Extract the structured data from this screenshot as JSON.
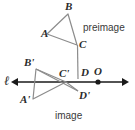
{
  "figure": {
    "background_color": "#ffffff",
    "stroke_color": "#808080",
    "line_color": "#1a1a1a",
    "label_color": "#2b2b2b"
  },
  "labels": {
    "A": "A",
    "B": "B",
    "C": "C",
    "D": "D",
    "O": "O",
    "A_prime": "A'",
    "B_prime": "B'",
    "C_prime": "C'",
    "D_prime": "D'",
    "line_l": "ℓ",
    "preimage": "preimage",
    "image": "image"
  },
  "geometry": {
    "preimage_points": {
      "A": [
        47,
        34
      ],
      "B": [
        68,
        14
      ],
      "C": [
        77,
        45
      ],
      "D": [
        78,
        78
      ]
    },
    "image_points": {
      "A_prime": [
        33,
        99
      ],
      "B_prime": [
        36,
        69
      ],
      "C_prime": [
        66,
        82
      ],
      "D_prime": [
        77,
        91
      ]
    },
    "center_point_O": [
      98,
      82
    ],
    "line_l": {
      "y": 82,
      "x_start": 10,
      "x_end": 128,
      "arrows_both_ends": true
    }
  }
}
